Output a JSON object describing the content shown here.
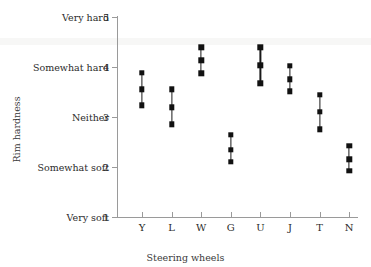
{
  "chart_data": {
    "type": "scatter",
    "title": "",
    "xlabel": "Steering wheels",
    "ylabel": "Rim hardness",
    "categories": [
      "Y",
      "L",
      "W",
      "G",
      "U",
      "J",
      "T",
      "N"
    ],
    "ylim": [
      1,
      5
    ],
    "grid": false,
    "legend": "none",
    "y_tick_values": [
      1,
      2,
      3,
      4,
      5
    ],
    "y_tick_labels": [
      "Very soft",
      "Somewhat soft",
      "Neither",
      "Somewhat hard",
      "Very hard"
    ],
    "series": [
      {
        "name": "upper",
        "values": [
          3.88,
          3.55,
          4.39,
          2.64,
          4.39,
          4.02,
          3.44,
          2.42
        ]
      },
      {
        "name": "mean",
        "values": [
          3.55,
          3.19,
          4.13,
          2.34,
          4.03,
          3.75,
          3.1,
          2.15
        ]
      },
      {
        "name": "lower",
        "values": [
          3.23,
          2.85,
          3.87,
          2.1,
          3.67,
          3.51,
          2.75,
          1.92
        ]
      }
    ],
    "marker": "filled-square",
    "marker_color": "#111111",
    "axis_color": "#9a9a9a"
  }
}
